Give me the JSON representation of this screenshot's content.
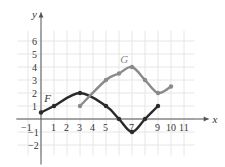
{
  "chart_data": {
    "type": "line",
    "title": "",
    "xlabel": "x",
    "ylabel": "y",
    "xlim": [
      -1,
      11
    ],
    "ylim": [
      -2,
      6
    ],
    "grid": true,
    "x_ticks": [
      "-1",
      "1",
      "2",
      "3",
      "4",
      "5",
      "7",
      "9",
      "10",
      "11"
    ],
    "y_ticks": [
      "6",
      "5",
      "4",
      "3",
      "2",
      "1",
      "-1",
      "-2"
    ],
    "series": [
      {
        "name": "F",
        "color": "#2a2a2a",
        "x": [
          0,
          1,
          3,
          5,
          6,
          7,
          8,
          9
        ],
        "y": [
          0.5,
          1,
          2,
          1,
          0,
          -1,
          0,
          1
        ]
      },
      {
        "name": "G",
        "color": "#8a8a8a",
        "x": [
          3,
          5,
          6,
          7,
          8,
          9,
          10
        ],
        "y": [
          1,
          3,
          3.5,
          4,
          3,
          2,
          2.5
        ]
      }
    ]
  }
}
